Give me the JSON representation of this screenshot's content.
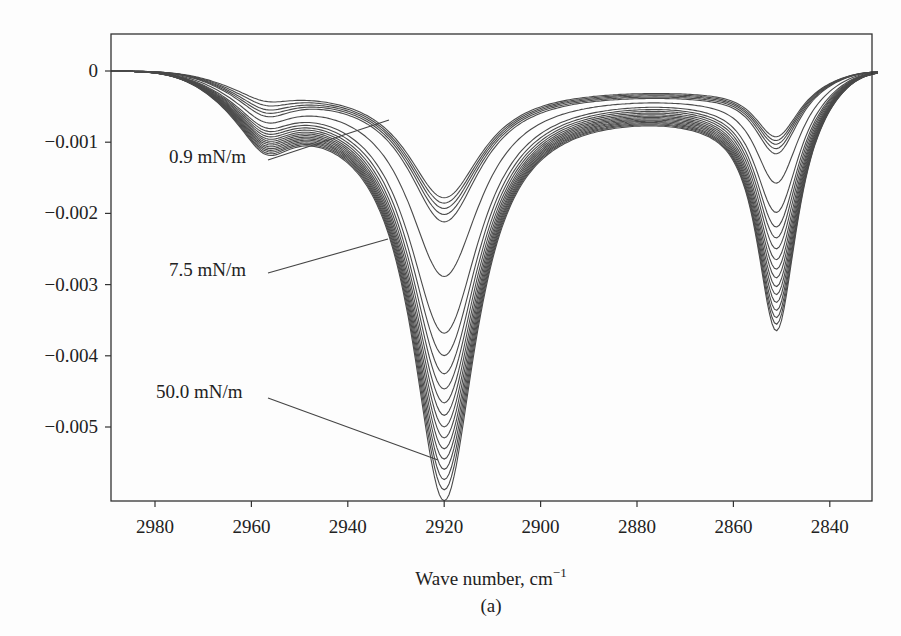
{
  "figure": {
    "panel_label": "(a)"
  },
  "chart_data": {
    "type": "line",
    "title": "",
    "xlabel": "Wave number, cm⁻¹",
    "xlabel_main": "Wave number, cm",
    "xlabel_sup": "−1",
    "ylabel": "",
    "xlim": [
      2989,
      2830
    ],
    "x_reversed": true,
    "ylim": [
      -0.006,
      0.0005
    ],
    "x_ticks": [
      2980,
      2960,
      2940,
      2920,
      2900,
      2880,
      2860,
      2840
    ],
    "x_tick_labels": [
      "2980",
      "2960",
      "2940",
      "2920",
      "2900",
      "2880",
      "2860",
      "2840"
    ],
    "y_ticks": [
      0,
      -0.001,
      -0.002,
      -0.003,
      -0.004,
      -0.005
    ],
    "y_tick_labels": [
      "0",
      "−0.001",
      "−0.002",
      "−0.003",
      "−0.004",
      "−0.005"
    ],
    "grid": false,
    "legend": "none",
    "series_description": "Family of ~20 IR absorbance-difference spectra at increasing surface pressure (0.9 to 50.0 mN/m); two absorption bands deepen monotonically with pressure.",
    "peaks": {
      "shoulder_cm": 2958,
      "asym_CH2_cm": 2920,
      "sym_CH2_cm": 2851
    },
    "series": [
      {
        "name": "0.9 mN/m",
        "min_2958": -0.00028,
        "min_2920": -0.00157,
        "min_2851": -0.00087
      },
      {
        "name": "",
        "min_2958": -0.00036,
        "min_2920": -0.00163,
        "min_2851": -0.00092
      },
      {
        "name": "",
        "min_2958": -0.00044,
        "min_2920": -0.00169,
        "min_2851": -0.00097
      },
      {
        "name": "",
        "min_2958": -0.0005,
        "min_2920": -0.00176,
        "min_2851": -0.00103
      },
      {
        "name": "",
        "min_2958": -0.00056,
        "min_2920": -0.00185,
        "min_2851": -0.0011
      },
      {
        "name": "7.5 mN/m",
        "min_2958": -0.00062,
        "min_2920": -0.0026,
        "min_2851": -0.0015
      },
      {
        "name": "",
        "min_2958": -0.00066,
        "min_2920": -0.00338,
        "min_2851": -0.0019
      },
      {
        "name": "",
        "min_2958": -0.00069,
        "min_2920": -0.00368,
        "min_2851": -0.0021
      },
      {
        "name": "",
        "min_2958": -0.00072,
        "min_2920": -0.00392,
        "min_2851": -0.00225
      },
      {
        "name": "",
        "min_2958": -0.00075,
        "min_2920": -0.00412,
        "min_2851": -0.0024
      },
      {
        "name": "",
        "min_2958": -0.00078,
        "min_2920": -0.0043,
        "min_2851": -0.00255
      },
      {
        "name": "",
        "min_2958": -0.0008,
        "min_2920": -0.00446,
        "min_2851": -0.00268
      },
      {
        "name": "",
        "min_2958": -0.00082,
        "min_2920": -0.00461,
        "min_2851": -0.0028
      },
      {
        "name": "",
        "min_2958": -0.00084,
        "min_2920": -0.00475,
        "min_2851": -0.00292
      },
      {
        "name": "",
        "min_2958": -0.00086,
        "min_2920": -0.00489,
        "min_2851": -0.00303
      },
      {
        "name": "",
        "min_2958": -0.00088,
        "min_2920": -0.00502,
        "min_2851": -0.00314
      },
      {
        "name": "",
        "min_2958": -0.0009,
        "min_2920": -0.00515,
        "min_2851": -0.00325
      },
      {
        "name": "",
        "min_2958": -0.00092,
        "min_2920": -0.00528,
        "min_2851": -0.00335
      },
      {
        "name": "",
        "min_2958": -0.00094,
        "min_2920": -0.00541,
        "min_2851": -0.00344
      },
      {
        "name": "50.0 mN/m",
        "min_2958": -0.00096,
        "min_2920": -0.00555,
        "min_2851": -0.00353
      }
    ],
    "annotations": [
      {
        "text": "0.9 mN/m",
        "label_x_px": 169,
        "label_y_px": 163,
        "line_from": [
          268,
          160
        ],
        "line_to": [
          389,
          120
        ],
        "points_to_series": 0
      },
      {
        "text": "7.5 mN/m",
        "label_x_px": 169,
        "label_y_px": 276,
        "line_from": [
          268,
          273
        ],
        "line_to": [
          388,
          239
        ],
        "points_to_series": 5
      },
      {
        "text": "50.0 mN/m",
        "label_x_px": 156,
        "label_y_px": 398,
        "line_from": [
          268,
          398
        ],
        "line_to": [
          438,
          460
        ],
        "points_to_series": 19
      }
    ]
  }
}
